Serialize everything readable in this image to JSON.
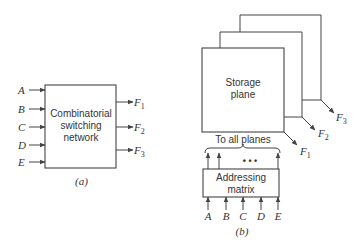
{
  "diagram_a": {
    "caption": "(a)",
    "box_label_lines": [
      "Combinatorial",
      "switching",
      "network"
    ],
    "inputs": [
      "A",
      "B",
      "C",
      "D",
      "E"
    ],
    "outputs": [
      {
        "letter": "F",
        "sub": "1"
      },
      {
        "letter": "F",
        "sub": "2"
      },
      {
        "letter": "F",
        "sub": "3"
      }
    ]
  },
  "diagram_b": {
    "caption": "(b)",
    "plane_label_lines": [
      "Storage",
      "plane"
    ],
    "brace_label": "To all planes",
    "ellipsis": "• • •",
    "matrix_label_lines": [
      "Addressing",
      "matrix"
    ],
    "inputs": [
      "A",
      "B",
      "C",
      "D",
      "E"
    ],
    "outputs": [
      {
        "letter": "F",
        "sub": "1"
      },
      {
        "letter": "F",
        "sub": "2"
      },
      {
        "letter": "F",
        "sub": "3"
      }
    ]
  }
}
